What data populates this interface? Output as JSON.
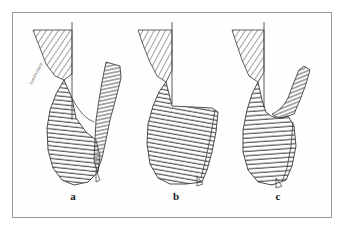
{
  "figure": {
    "background_color": "#ffffff",
    "frame": {
      "border_color": "#9a9a9a",
      "fill_color": "#fefefe",
      "x": 12,
      "y": 12,
      "width": 320,
      "height": 206
    },
    "ink_color": "#333333",
    "hatch_color": "#555555",
    "outline_color": "#2a2a2a"
  },
  "panels": [
    {
      "id": "a",
      "label": "a",
      "label_x": 65,
      "label_y": 190,
      "description": "Cross-section with separated hatched flap displaced to the right and a narrow gap between the two hatched masses"
    },
    {
      "id": "b",
      "label": "b",
      "label_x": 168,
      "label_y": 190,
      "description": "Cross-section with the hatched masses in contact, forming a continuous profile with a stepped shoulder at the right"
    },
    {
      "id": "c",
      "label": "c",
      "label_x": 270,
      "label_y": 190,
      "description": "Cross-section with a hooked hatched process curving over the notch at the upper right"
    }
  ],
  "annotations": [
    {
      "id": "hand-note",
      "text": "handwritten",
      "x": 28,
      "y": 83,
      "rotation_deg": -62,
      "color": "#5d5d5d"
    }
  ]
}
